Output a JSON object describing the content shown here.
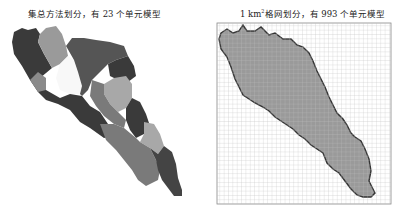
{
  "left_panel": {
    "title": "集总方法划分，有 23 个单元模型",
    "unit_count": 23,
    "colors": [
      "#3a3a3a",
      "#555555",
      "#7a7a7a",
      "#9a9a9a",
      "#b0b0b0",
      "#ffffff"
    ]
  },
  "right_panel": {
    "title_prefix": "1 km",
    "title_sup": "2",
    "title_suffix": "格网划分，有 993 个单元模型",
    "unit_count": 993,
    "fill_color": "#9a9a9a",
    "grid_color": "#bdbdbd",
    "outline_color": "#333333"
  }
}
